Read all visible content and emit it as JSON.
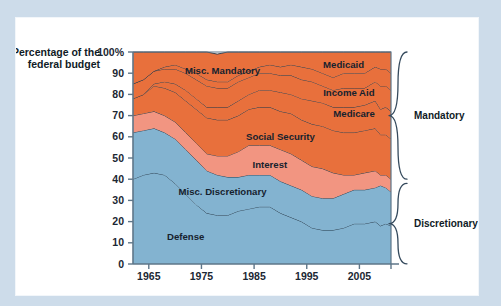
{
  "colors": {
    "page_background": "#cddcea",
    "card_background": "#ffffff",
    "orange": "#e8703c",
    "salmon": "#f29581",
    "blue": "#83b3d0",
    "axis": "#5e7689",
    "line": "#23384a",
    "text": "#101b26"
  },
  "chart_data": {
    "type": "area",
    "title": "",
    "subtitle": "",
    "xlabel": "",
    "ylabel": "Percentage of the federal budget",
    "ylabel_line1": "Percentage of the",
    "ylabel_line2": "federal budget",
    "grid": false,
    "legend_position": "inline-labels",
    "xlim": [
      1962,
      2011
    ],
    "ylim": [
      0,
      100
    ],
    "yticks": [
      0,
      10,
      20,
      30,
      40,
      50,
      60,
      70,
      80,
      90,
      100
    ],
    "ytick_labels": [
      "0",
      "10",
      "20",
      "30",
      "40",
      "50",
      "60",
      "70",
      "80",
      "90",
      "100%"
    ],
    "xticks": [
      1965,
      1975,
      1985,
      1995,
      2005,
      2011
    ],
    "xtick_labels": [
      "1965",
      "1975",
      "1985",
      "1995",
      "2005",
      ""
    ],
    "x": [
      1962,
      1964,
      1966,
      1968,
      1970,
      1972,
      1974,
      1976,
      1978,
      1980,
      1982,
      1984,
      1986,
      1988,
      1990,
      1992,
      1994,
      1996,
      1998,
      2000,
      2002,
      2004,
      2006,
      2008,
      2009,
      2010,
      2011
    ],
    "series": [
      {
        "name": "Defense",
        "label": "Defense",
        "color": "#83b3d0",
        "group": "Discretionary",
        "label_x": 1972,
        "label_y": 13,
        "values": [
          40,
          42,
          43,
          42,
          38,
          33,
          28,
          24,
          23,
          23,
          25,
          26,
          27,
          27,
          24,
          22,
          20,
          17,
          16,
          16,
          17,
          19,
          19,
          20,
          18,
          19,
          18
        ]
      },
      {
        "name": "Misc. Discretionary",
        "label": "Misc. Discretionary",
        "color": "#83b3d0",
        "group": "Discretionary",
        "label_x": 1979,
        "label_y": 34,
        "values": [
          22,
          21,
          21,
          20,
          21,
          21,
          21,
          20,
          19,
          18,
          16,
          16,
          15,
          15,
          15,
          15,
          15,
          15,
          15,
          15,
          16,
          16,
          16,
          16,
          19,
          17,
          16
        ]
      },
      {
        "name": "Interest",
        "label": "Interest",
        "color": "#f29581",
        "group": "Mandatory",
        "label_x": 1988,
        "label_y": 47,
        "values": [
          8,
          8,
          8,
          8,
          8,
          8,
          8,
          8,
          9,
          10,
          12,
          14,
          14,
          14,
          15,
          15,
          14,
          14,
          14,
          12,
          9,
          7,
          8,
          8,
          5,
          6,
          6
        ]
      },
      {
        "name": "Social Security",
        "label": "Social Security",
        "color": "#e8703c",
        "group": "Mandatory",
        "label_x": 1990,
        "label_y": 60,
        "values": [
          8,
          9,
          12,
          13,
          14,
          15,
          16,
          17,
          17,
          17,
          17,
          17,
          18,
          18,
          18,
          19,
          19,
          20,
          20,
          20,
          20,
          20,
          20,
          20,
          19,
          19,
          19
        ]
      },
      {
        "name": "Medicare",
        "label": "Medicare",
        "color": "#e8703c",
        "group": "Mandatory",
        "label_x": 2004,
        "label_y": 71,
        "values": [
          0,
          0,
          1,
          3,
          4,
          5,
          5,
          5,
          6,
          6,
          7,
          7,
          8,
          8,
          9,
          9,
          10,
          11,
          11,
          11,
          12,
          12,
          12,
          13,
          12,
          13,
          13
        ]
      },
      {
        "name": "Income Aid",
        "label": "Income Aid",
        "color": "#e8703c",
        "group": "Mandatory",
        "label_x": 2003,
        "label_y": 81,
        "values": [
          7,
          7,
          6,
          6,
          7,
          8,
          9,
          10,
          9,
          9,
          9,
          8,
          8,
          8,
          8,
          9,
          9,
          9,
          8,
          8,
          9,
          9,
          8,
          9,
          11,
          10,
          10
        ]
      },
      {
        "name": "Medicaid",
        "label": "Medicaid",
        "color": "#e8703c",
        "group": "Mandatory",
        "label_x": 2002,
        "label_y": 94,
        "values": [
          0,
          0,
          0,
          1,
          2,
          2,
          3,
          3,
          3,
          3,
          3,
          3,
          3,
          4,
          4,
          5,
          6,
          6,
          6,
          6,
          7,
          7,
          7,
          7,
          8,
          8,
          8
        ]
      },
      {
        "name": "Misc. Mandatory",
        "label": "Misc. Mandatory",
        "color": "#e8703c",
        "group": "Mandatory",
        "label_x": 1979,
        "label_y": 91,
        "values": [
          15,
          13,
          9,
          7,
          6,
          8,
          10,
          13,
          13,
          14,
          11,
          9,
          7,
          6,
          7,
          6,
          7,
          8,
          10,
          12,
          10,
          10,
          10,
          7,
          8,
          8,
          10
        ]
      }
    ],
    "brackets": [
      {
        "label": "Mandatory",
        "from": 40,
        "to": 100
      },
      {
        "label": "Discretionary",
        "from": 0,
        "to": 38
      }
    ]
  }
}
